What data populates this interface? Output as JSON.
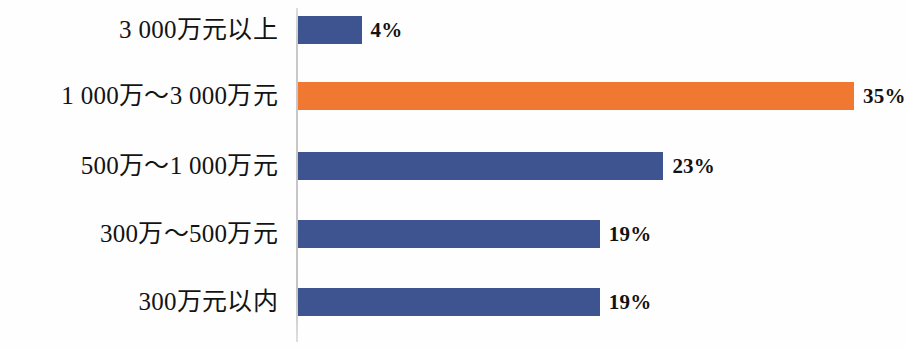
{
  "chart_data": {
    "type": "bar",
    "orientation": "horizontal",
    "title": "",
    "subtitle": "",
    "xlabel": "",
    "ylabel": "",
    "grid": false,
    "legend": false,
    "legend_position": "none",
    "axis_line": true,
    "xlim": [
      0,
      38
    ],
    "value_suffix": "%",
    "categories": [
      "3 000万元以上",
      "1 000万～3 000万元",
      "500万～1 000万元",
      "300万～500万元",
      "300万元以内"
    ],
    "values": [
      4,
      35,
      23,
      19,
      19
    ],
    "value_labels": [
      "4%",
      "35%",
      "23%",
      "19%",
      "19%"
    ],
    "bar_colors": [
      "#3d5491",
      "#f07830",
      "#3d5491",
      "#3d5491",
      "#3d5491"
    ],
    "highlight_index": 1,
    "colors": {
      "primary": "#3d5491",
      "accent": "#f07830",
      "axis": "#c9c9c9",
      "text": "#131313",
      "background": "#fefefe"
    }
  }
}
